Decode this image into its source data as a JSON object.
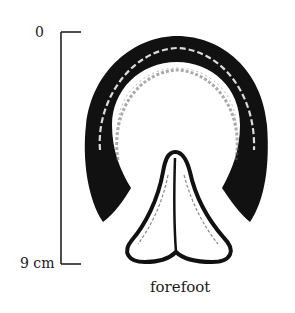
{
  "scale_bar": {
    "top_label": "0",
    "bottom_label": "9 cm"
  },
  "figure": {
    "caption": "forefoot",
    "ink_color": "#111111",
    "background_color": "#ffffff"
  }
}
